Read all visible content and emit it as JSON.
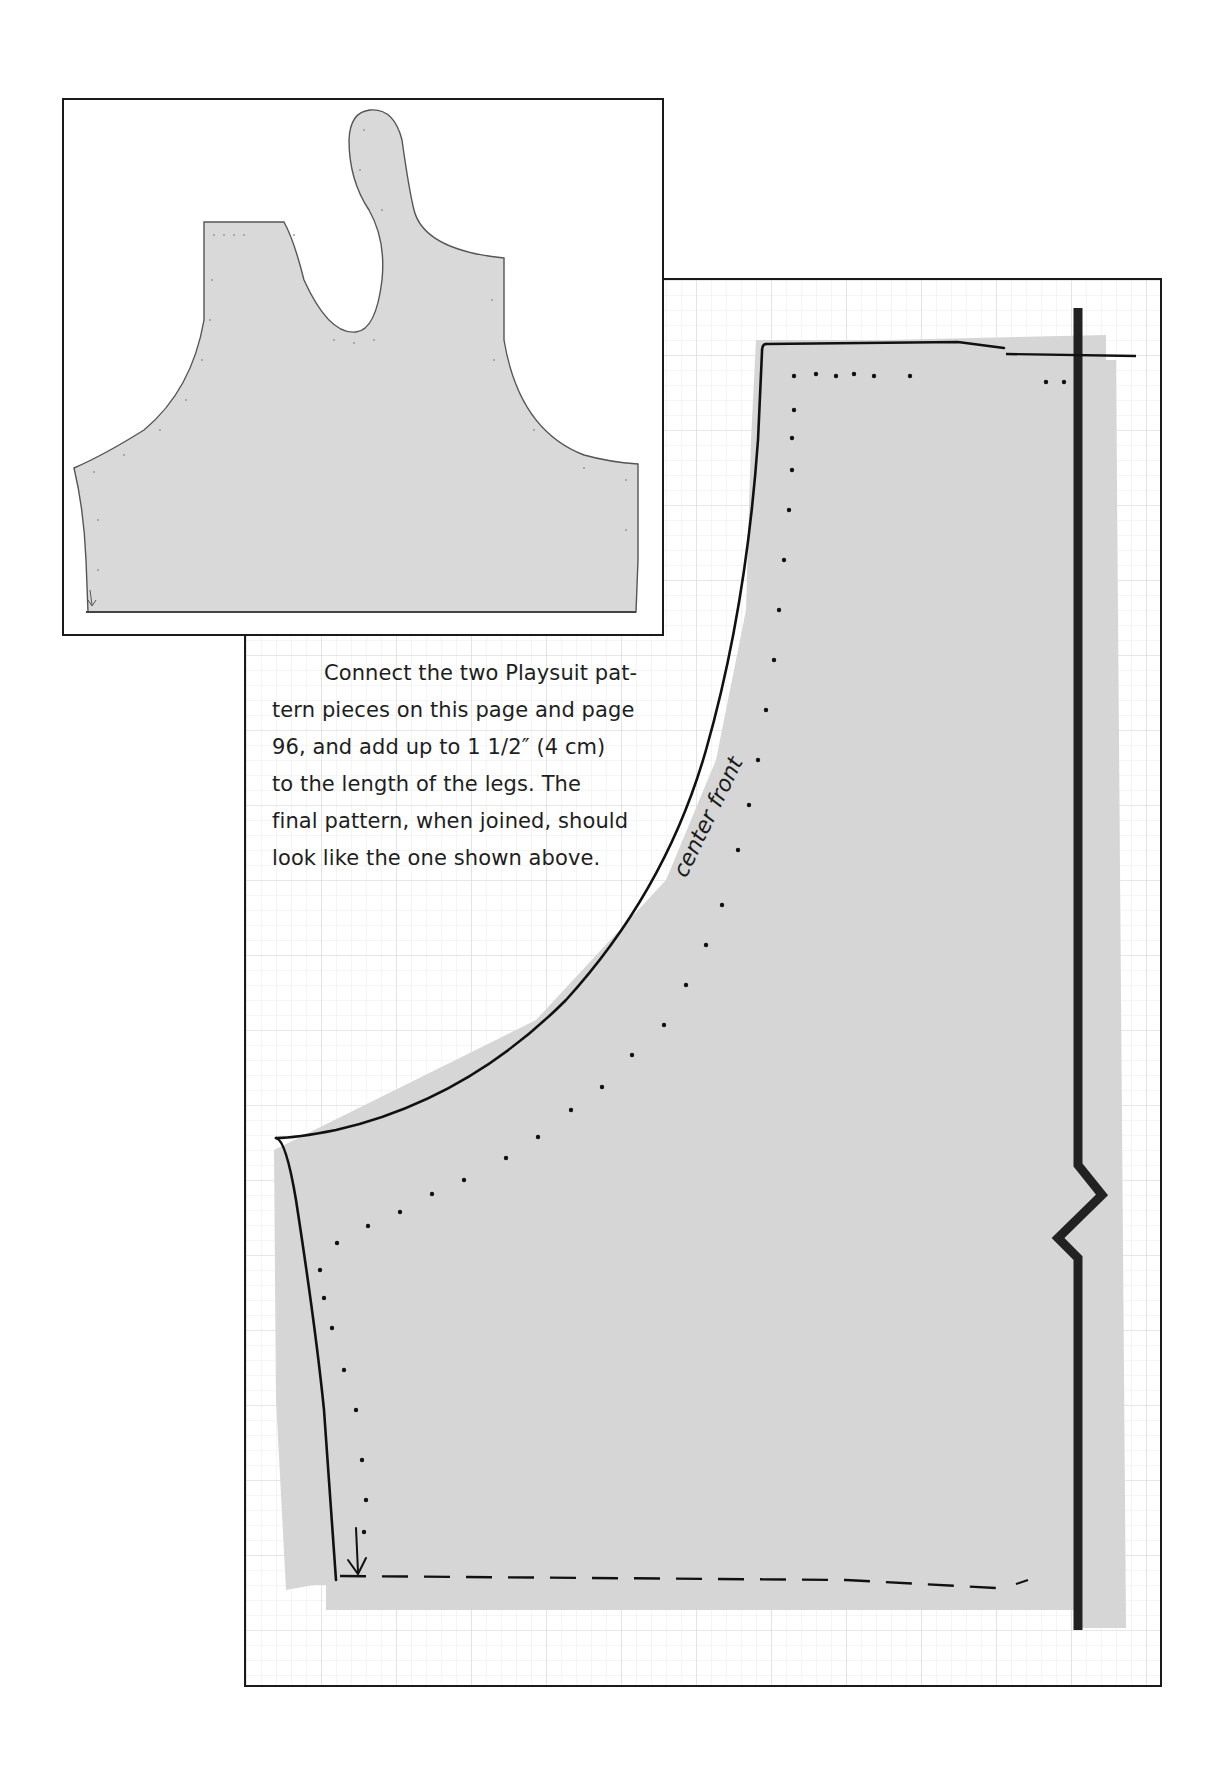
{
  "page": {
    "instructions": "Connect the two Playsuit pattern pieces on this page and page 96, and add up to 1 1/2″ (4 cm) to the length of the legs. The final pattern, when joined, should look like the one shown above.",
    "instructions_lines": [
      "Connect the two Playsuit pat-",
      "tern pieces on this page and page",
      "96, and add up to 1 1/2″ (4 cm)",
      "to the length of the legs. The",
      "final pattern, when joined, should",
      "look like the one shown above."
    ],
    "pattern_label": "center front"
  },
  "inset": {
    "description": "Completed joined playsuit pattern preview",
    "fill_color": "#d9d9d9"
  },
  "pattern": {
    "fill_color": "#d6d6d6",
    "grid_color": "#e2e2e2",
    "outline_color": "#111111",
    "fold_line_color": "#222222"
  }
}
